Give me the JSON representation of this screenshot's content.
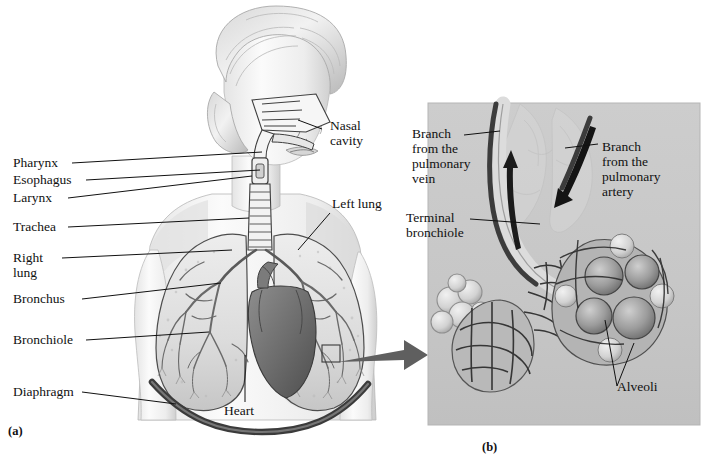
{
  "figure": {
    "type": "anatomical-illustration",
    "style": "grayscale medical illustration, two panels",
    "panels": [
      {
        "id": "a",
        "caption": "(a)",
        "content": "Female head and thorax, cutaway showing airways, lungs, bronchial tree, heart and diaphragm"
      },
      {
        "id": "b",
        "caption": "(b)",
        "content": "Magnified detail of a terminal bronchiole with alveolar sacs and pulmonary capillary network, shown on a gray background panel"
      }
    ]
  },
  "panel_a": {
    "labels_left": [
      {
        "key": "pharynx",
        "text": "Pharynx"
      },
      {
        "key": "esophagus",
        "text": "Esophagus"
      },
      {
        "key": "larynx",
        "text": "Larynx"
      },
      {
        "key": "trachea",
        "text": "Trachea"
      },
      {
        "key": "right-lung",
        "text": "Right\nlung"
      },
      {
        "key": "bronchus",
        "text": "Bronchus"
      },
      {
        "key": "bronchiole",
        "text": "Bronchiole"
      },
      {
        "key": "diaphragm",
        "text": "Diaphragm"
      }
    ],
    "labels_right": [
      {
        "key": "nasal-cavity",
        "text": "Nasal\ncavity"
      },
      {
        "key": "left-lung",
        "text": "Left lung"
      }
    ],
    "labels_inner": [
      {
        "key": "heart",
        "text": "Heart"
      }
    ],
    "caption": "(a)"
  },
  "panel_b": {
    "labels": [
      {
        "key": "branch-pulmonary-vein",
        "text": "Branch\nfrom the\npulmonary\nvein"
      },
      {
        "key": "terminal-bronchiole",
        "text": "Terminal\nbronchiole"
      },
      {
        "key": "branch-pulmonary-artery",
        "text": "Branch\nfrom the\npulmonary\nartery"
      },
      {
        "key": "alveoli",
        "text": "Alveoli"
      }
    ],
    "caption": "(b)"
  },
  "colors": {
    "ink": "#111111",
    "leader_line": "#1a1a1a",
    "panel_background": "#c9c9c9",
    "panel_border": "#bdbdbd",
    "arrow": "#5a5a5a",
    "page_background": "#ffffff",
    "tissue_light": "#efefef",
    "tissue_mid": "#c2c2c2",
    "tissue_dark": "#6f6f6f",
    "vessel_dark": "#3d3d3d"
  }
}
